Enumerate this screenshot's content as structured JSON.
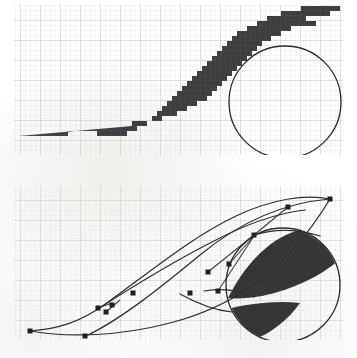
{
  "figure": {
    "kind": "two-panel-comparison-diagram",
    "background_color": "#ffffff",
    "ink_color": "#363636",
    "outline_color": "#2b2b2b",
    "grid": {
      "minor_color": "#d9dcd8",
      "major_color": "#b6bcb6",
      "minor_spacing_px": 5,
      "major_every": 4
    },
    "panels": [
      {
        "id": "raster-panel",
        "label": "raster",
        "description": "Bitmap rendering: the shape is approximated by filled square pixels producing stair-stepped (aliased) edges.",
        "frame": {
          "x": 14,
          "y": 5,
          "width": 329,
          "height": 150
        },
        "fill_color": "#363636",
        "magnifier": {
          "center_x": 285,
          "center_y": 102,
          "radius": 56,
          "stroke_color": "#2b2b2b",
          "stroke_width": 1.3,
          "contents": "stair-stepped pixel staircase along the lower-right edge"
        }
      },
      {
        "id": "vector-panel",
        "label": "vector",
        "description": "Outline rendering: the same shape described by Bezier curve segments with square on-curve and off-curve control points.",
        "frame": {
          "x": 14,
          "y": 186,
          "width": 329,
          "height": 154
        },
        "fill_color": "#363636",
        "curve_stroke_color": "#2f2f2f",
        "curve_stroke_width": 1.25,
        "control_point": {
          "shape": "square",
          "size_px": 5,
          "fill_color": "#1f1f1f",
          "count": 12
        },
        "handle_line_color": "#3a3a3a",
        "magnifier": {
          "center_x": 283,
          "center_y": 285,
          "radius": 57,
          "stroke_color": "#2b2b2b",
          "stroke_width": 1.3,
          "contents": "smooth anti-aliased curved edges of the filled outline"
        }
      }
    ],
    "control_points": [
      {
        "index": 0,
        "x": 30,
        "y": 331,
        "type": "on-curve"
      },
      {
        "index": 1,
        "x": 85,
        "y": 336,
        "type": "on-curve"
      },
      {
        "index": 2,
        "x": 98,
        "y": 308,
        "type": "off-curve"
      },
      {
        "index": 3,
        "x": 106,
        "y": 312,
        "type": "off-curve"
      },
      {
        "index": 4,
        "x": 112,
        "y": 305,
        "type": "off-curve"
      },
      {
        "index": 5,
        "x": 133,
        "y": 293,
        "type": "off-curve"
      },
      {
        "index": 6,
        "x": 190,
        "y": 293,
        "type": "off-curve"
      },
      {
        "index": 7,
        "x": 208,
        "y": 272,
        "type": "off-curve"
      },
      {
        "index": 8,
        "x": 218,
        "y": 291,
        "type": "off-curve"
      },
      {
        "index": 9,
        "x": 229,
        "y": 264,
        "type": "off-curve"
      },
      {
        "index": 10,
        "x": 254,
        "y": 235,
        "type": "on-curve"
      },
      {
        "index": 11,
        "x": 288,
        "y": 207,
        "type": "on-curve"
      },
      {
        "index": 12,
        "x": 330,
        "y": 199,
        "type": "on-curve"
      }
    ]
  }
}
